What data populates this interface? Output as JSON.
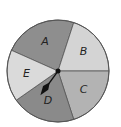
{
  "diagram": {
    "type": "spinner",
    "center": [
      58,
      71
    ],
    "radius": 51,
    "sectors": [
      {
        "label": "A",
        "start_deg": -156,
        "end_deg": -72,
        "color": "#8e8e8e"
      },
      {
        "label": "B",
        "start_deg": -72,
        "end_deg": 0,
        "color": "#d4d4d4"
      },
      {
        "label": "C",
        "start_deg": 0,
        "end_deg": 72,
        "color": "#b3b3b3"
      },
      {
        "label": "D",
        "start_deg": 72,
        "end_deg": 145,
        "color": "#8a8a8a"
      },
      {
        "label": "E",
        "start_deg": 145,
        "end_deg": 204,
        "color": "#dadada"
      }
    ],
    "pointer": {
      "points_to": "D",
      "angle_deg": 126,
      "color": "#111111"
    }
  }
}
